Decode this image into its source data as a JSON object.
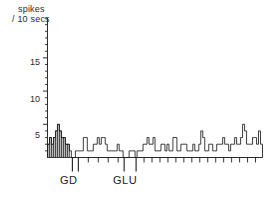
{
  "chart_data": {
    "type": "bar",
    "title": "",
    "ylabel": "spikes / 10 secs",
    "ylabel_line1": "spikes",
    "ylabel_line2": "/ 10 secs",
    "xlabel": "",
    "ylim": [
      0,
      21
    ],
    "yticks_major": [
      5,
      10,
      15
    ],
    "ytick_labels": [
      "5",
      "10",
      "15"
    ],
    "ytick_minor_step": 1,
    "grid": false,
    "legend": null,
    "bin_width_seconds": 10,
    "x_axis_visible_range_bins": [
      0,
      108
    ],
    "categories_note": "consecutive 10-second bins",
    "shaded_bins_start": 0,
    "shaded_bins_end": 11,
    "values": [
      2,
      3,
      2,
      3,
      4,
      5,
      4,
      3,
      3,
      2,
      2,
      1,
      0,
      0,
      1,
      1,
      1,
      1,
      3,
      3,
      1,
      1,
      1,
      2,
      2,
      3,
      2,
      3,
      3,
      2,
      1,
      1,
      1,
      1,
      1,
      2,
      1,
      1,
      0,
      0,
      0,
      1,
      1,
      1,
      0,
      1,
      1,
      1,
      2,
      2,
      3,
      2,
      2,
      3,
      1,
      1,
      1,
      2,
      2,
      1,
      2,
      1,
      1,
      3,
      3,
      1,
      1,
      2,
      2,
      2,
      1,
      1,
      1,
      2,
      1,
      1,
      2,
      4,
      3,
      1,
      1,
      2,
      2,
      1,
      1,
      2,
      2,
      2,
      3,
      2,
      2,
      1,
      2,
      2,
      3,
      2,
      2,
      3,
      5,
      4,
      2,
      2,
      2,
      3,
      3,
      2,
      4,
      2
    ],
    "annotations": [
      {
        "label": "GD",
        "type": "drug-application-marker",
        "bin_positions": [
          12,
          15
        ]
      },
      {
        "label": "GLU",
        "type": "drug-application-marker",
        "bin_positions": [
          38,
          44
        ]
      }
    ],
    "event_marker_bins": [
      12,
      15,
      20,
      25,
      30,
      35,
      38,
      44,
      48,
      52,
      56,
      60,
      64,
      68,
      72,
      76,
      80,
      84,
      88,
      92,
      96,
      100,
      104
    ]
  },
  "axis": {
    "y_label_line1": "spikes",
    "y_label_line2": "/ 10 secs",
    "tick_15": "15",
    "tick_10": "10",
    "tick_5": "5"
  },
  "markers": {
    "gd": "GD",
    "glu": "GLU"
  },
  "colors": {
    "ink": "#1a1a1a",
    "shade": "#b9b9b9",
    "background": "#ffffff"
  }
}
